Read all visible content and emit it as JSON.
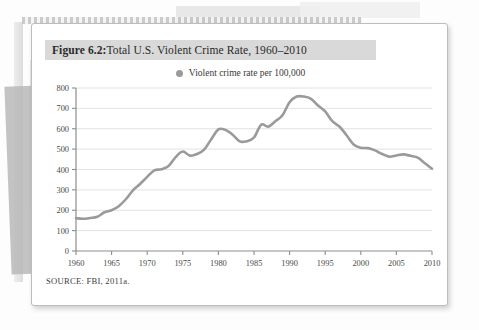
{
  "figure": {
    "number": "Figure 6.2:",
    "title": " Total U.S. Violent Crime Rate, 1960–2010",
    "source": "SOURCE: FBI, 2011a."
  },
  "legend": {
    "label": "Violent crime rate per 100,000",
    "swatch_name": "legend-dot"
  },
  "colors": {
    "line": "#9a9a9a",
    "grid": "#e2e2e2",
    "axis": "#8d8d8d",
    "title_band": "#d9d9d9",
    "card": "#ffffff",
    "text": "#3c3c3c"
  },
  "chart_data": {
    "type": "line",
    "title": "Total U.S. Violent Crime Rate, 1960–2010",
    "xlabel": "",
    "ylabel": "",
    "xlim": [
      1960,
      2010
    ],
    "ylim": [
      0,
      800
    ],
    "grid": true,
    "legend_position": "top-center",
    "xticks": [
      1960,
      1965,
      1970,
      1975,
      1980,
      1985,
      1990,
      1995,
      2000,
      2005,
      2010
    ],
    "yticks": [
      0,
      100,
      200,
      300,
      400,
      500,
      600,
      700,
      800
    ],
    "series": [
      {
        "name": "Violent crime rate per 100,000",
        "x": [
          1960,
          1961,
          1962,
          1963,
          1964,
          1965,
          1966,
          1967,
          1968,
          1969,
          1970,
          1971,
          1972,
          1973,
          1974,
          1975,
          1976,
          1977,
          1978,
          1979,
          1980,
          1981,
          1982,
          1983,
          1984,
          1985,
          1986,
          1987,
          1988,
          1989,
          1990,
          1991,
          1992,
          1993,
          1994,
          1995,
          1996,
          1997,
          1998,
          1999,
          2000,
          2001,
          2002,
          2003,
          2004,
          2005,
          2006,
          2007,
          2008,
          2009,
          2010
        ],
        "values": [
          161,
          158,
          162,
          168,
          190,
          200,
          220,
          254,
          298,
          329,
          364,
          396,
          401,
          417,
          461,
          488,
          468,
          476,
          498,
          549,
          597,
          594,
          571,
          538,
          539,
          557,
          620,
          610,
          637,
          666,
          730,
          758,
          758,
          747,
          714,
          685,
          637,
          611,
          568,
          523,
          507,
          505,
          494,
          476,
          463,
          469,
          474,
          467,
          458,
          431,
          404
        ]
      }
    ]
  }
}
